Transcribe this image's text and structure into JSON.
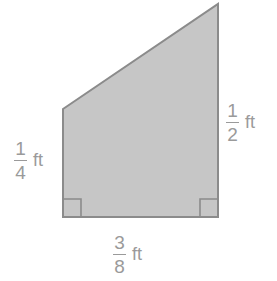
{
  "figure": {
    "type": "right-trapezoid",
    "fill_color": "#c6c6c6",
    "stroke_color": "#8b8b8b",
    "background_color": "#ffffff",
    "label_color": "#9a9a9a",
    "vertices": [
      {
        "name": "top-left",
        "x": 63,
        "y": 109
      },
      {
        "name": "top-right-apex",
        "x": 218,
        "y": 4
      },
      {
        "name": "bottom-right",
        "x": 218,
        "y": 217
      },
      {
        "name": "bottom-left",
        "x": 63,
        "y": 217
      }
    ],
    "right_angle_markers": [
      {
        "name": "bottom-left-right-angle",
        "x": 63,
        "y": 199,
        "size": 18
      },
      {
        "name": "bottom-right-right-angle",
        "x": 200,
        "y": 199,
        "size": 18
      }
    ]
  },
  "labels": {
    "left": {
      "numerator": "1",
      "denominator": "4",
      "unit": "ft",
      "full_text": "1/4 ft"
    },
    "right": {
      "numerator": "1",
      "denominator": "2",
      "unit": "ft",
      "full_text": "1/2 ft"
    },
    "bottom": {
      "numerator": "3",
      "denominator": "8",
      "unit": "ft",
      "full_text": "3/8 ft"
    }
  }
}
